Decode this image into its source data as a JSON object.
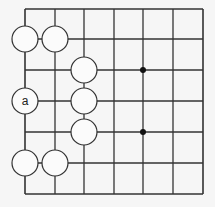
{
  "diagram": {
    "type": "go-board-fragment",
    "grid": {
      "columns": 7,
      "rows": 7,
      "x_lines": [
        25,
        55,
        84,
        114,
        143,
        173,
        203
      ],
      "y_lines": [
        9,
        39,
        70,
        101,
        132,
        163,
        194
      ],
      "line_color": "#333333",
      "background": "#f6f6f6"
    },
    "star_points": [
      {
        "col": 4,
        "row": 2
      },
      {
        "col": 4,
        "row": 4
      }
    ],
    "stones": [
      {
        "col": 0,
        "row": 1,
        "color": "white",
        "label": ""
      },
      {
        "col": 1,
        "row": 1,
        "color": "white",
        "label": ""
      },
      {
        "col": 2,
        "row": 2,
        "color": "white",
        "label": ""
      },
      {
        "col": 0,
        "row": 3,
        "color": "white",
        "label": "a"
      },
      {
        "col": 2,
        "row": 3,
        "color": "white",
        "label": ""
      },
      {
        "col": 2,
        "row": 4,
        "color": "white",
        "label": ""
      },
      {
        "col": 0,
        "row": 5,
        "color": "white",
        "label": ""
      },
      {
        "col": 1,
        "row": 5,
        "color": "white",
        "label": ""
      }
    ],
    "stone_radius": 13
  }
}
